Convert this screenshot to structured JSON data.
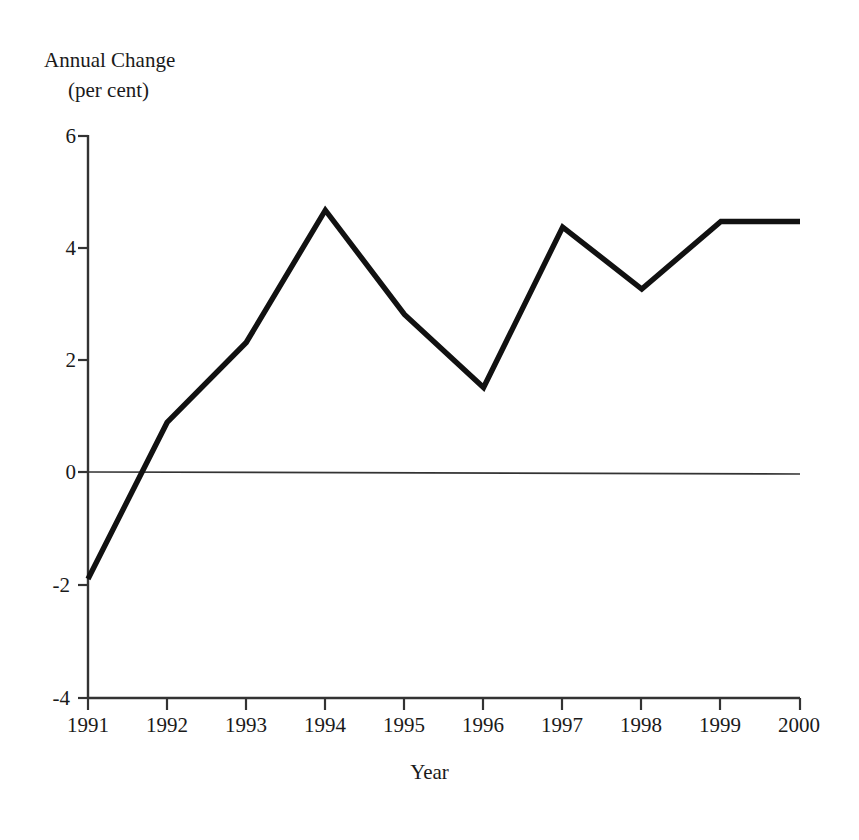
{
  "chart_data": {
    "type": "line",
    "title": "",
    "subtitle": "",
    "ylabel": "Annual Change",
    "ylabel_units": "(per cent)",
    "xlabel": "Year",
    "categories": [
      "1991",
      "1992",
      "1993",
      "1994",
      "1995",
      "1996",
      "1997",
      "1998",
      "1999",
      "2000"
    ],
    "x": [
      1991,
      1992,
      1993,
      1994,
      1995,
      1996,
      1997,
      1998,
      1999,
      2000
    ],
    "values": [
      -1.9,
      0.88,
      2.3,
      4.65,
      2.8,
      1.5,
      4.35,
      3.25,
      4.45,
      4.45
    ],
    "series": [
      {
        "name": "Annual Change (per cent)",
        "values": [
          -1.9,
          0.88,
          2.3,
          4.65,
          2.8,
          1.5,
          4.35,
          3.25,
          4.45,
          4.45
        ]
      }
    ],
    "ylim": [
      -4,
      6
    ],
    "xlim": [
      1991,
      2000
    ],
    "yticks": [
      6,
      4,
      2,
      0,
      -2,
      -4
    ],
    "ytick_labels": [
      "6",
      "4",
      "2",
      "0",
      "-2",
      "-4"
    ],
    "xticks": [
      1991,
      1992,
      1993,
      1994,
      1995,
      1996,
      1997,
      1998,
      1999,
      2000
    ],
    "xtick_labels": [
      "1991",
      "1992",
      "1993",
      "1994",
      "1995",
      "1996",
      "1997",
      "1998",
      "1999",
      "2000"
    ],
    "grid": false,
    "zero_line": true,
    "legend": "none",
    "line_color": "#111111",
    "axis_color": "#333333",
    "background_color": "#ffffff"
  },
  "axes": {
    "y_title_line1": "Annual Change",
    "y_title_line2": "(per cent)",
    "x_title": "Year"
  },
  "ytick_labels": {
    "t0": "6",
    "t1": "4",
    "t2": "2",
    "t3": "0",
    "t4": "-2",
    "t5": "-4"
  },
  "xtick_labels": {
    "t0": "1991",
    "t1": "1992",
    "t2": "1993",
    "t3": "1994",
    "t4": "1995",
    "t5": "1996",
    "t6": "1997",
    "t7": "1998",
    "t8": "1999",
    "t9": "2000"
  }
}
